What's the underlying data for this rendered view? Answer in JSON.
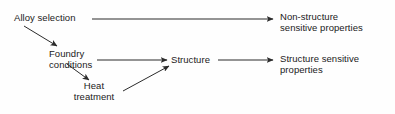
{
  "diagram": {
    "stroke_color": "#2b2b2b",
    "text_color": "#1a1a1a",
    "background_color": "#fefefe",
    "nodes": [
      {
        "id": "alloy-selection",
        "name": "alloy-selection",
        "lines": [
          "Alloy selection"
        ]
      },
      {
        "id": "foundry-conditions",
        "name": "foundry-conditions",
        "lines": [
          "Foundry",
          "conditions"
        ]
      },
      {
        "id": "heat-treatment",
        "name": "heat-treatment",
        "lines": [
          "Heat",
          "treatment"
        ]
      },
      {
        "id": "structure",
        "name": "structure",
        "lines": [
          "Structure"
        ]
      },
      {
        "id": "non-structure-sensitive-properties",
        "name": "non-structure-sensitive-properties",
        "lines": [
          "Non-structure",
          "sensitive properties"
        ]
      },
      {
        "id": "structure-sensitive-properties",
        "name": "structure-sensitive-properties",
        "lines": [
          "Structure sensitive",
          "properties"
        ]
      }
    ],
    "edges": [
      {
        "id": "alloy-to-non-structure",
        "from": "alloy-selection",
        "to": "non-structure-sensitive-properties",
        "x1": 92,
        "y1": 19,
        "x2": 273,
        "y2": 19
      },
      {
        "id": "alloy-to-foundry",
        "from": "alloy-selection",
        "to": "foundry-conditions",
        "x1": 24,
        "y1": 26,
        "x2": 57,
        "y2": 46
      },
      {
        "id": "foundry-to-structure",
        "from": "foundry-conditions",
        "to": "structure",
        "x1": 97,
        "y1": 60,
        "x2": 167,
        "y2": 60
      },
      {
        "id": "foundry-to-heat",
        "from": "foundry-conditions",
        "to": "heat-treatment",
        "x1": 67,
        "y1": 64,
        "x2": 89,
        "y2": 80
      },
      {
        "id": "heat-to-structure",
        "from": "heat-treatment",
        "to": "structure",
        "x1": 123,
        "y1": 91,
        "x2": 169,
        "y2": 66
      },
      {
        "id": "structure-to-structure-sensitive",
        "from": "structure",
        "to": "structure-sensitive-properties",
        "x1": 218,
        "y1": 60,
        "x2": 273,
        "y2": 60
      }
    ]
  }
}
